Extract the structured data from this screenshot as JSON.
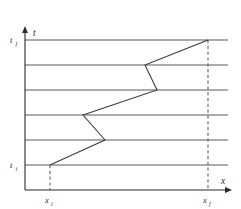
{
  "figure": {
    "kind": "spacetime-diagram",
    "axes": {
      "x_axis_label": "x",
      "t_axis_label": "t",
      "x_axis_label_name": "x-axis-label",
      "t_axis_label_name": "t-axis-label"
    },
    "ticks": {
      "t_initial_base": "t",
      "t_initial_sub": "i",
      "t_final_base": "t",
      "t_final_sub": "f",
      "x_initial_base": "x",
      "x_initial_sub": "i",
      "x_final_base": "x",
      "x_final_sub": "f"
    },
    "colors": {
      "axis": "#2b2b2b",
      "slice": "#5a5a5a",
      "path": "#3a3a3a",
      "background": "#ffffff"
    },
    "geometry": {
      "origin_x": 25,
      "origin_y": 190,
      "t_axis_top": 28,
      "x_axis_right": 232,
      "slice_left": 25,
      "slice_right": 228,
      "time_slice_y": [
        40,
        65,
        90,
        115,
        140,
        165
      ],
      "x_initial": 50,
      "x_final": 208,
      "dashed_x_i_top": 165,
      "dashed_x_i_bottom": 190,
      "dashed_x_f_top": 40,
      "dashed_x_f_bottom": 190
    },
    "worldline": {
      "name": "particle-worldline",
      "points": "50,165 105,140 83,115 157,90 145,65 208,40",
      "vertices": [
        {
          "x": 50,
          "t": 165,
          "slice": 0,
          "label": "start-at-x-i-t-i"
        },
        {
          "x": 105,
          "t": 140,
          "slice": 1,
          "label": "vertex-1"
        },
        {
          "x": 83,
          "t": 115,
          "slice": 2,
          "label": "vertex-2"
        },
        {
          "x": 157,
          "t": 90,
          "slice": 3,
          "label": "vertex-3"
        },
        {
          "x": 145,
          "t": 65,
          "slice": 4,
          "label": "vertex-4"
        },
        {
          "x": 208,
          "t": 40,
          "slice": 5,
          "label": "end-at-x-f-t-f"
        }
      ]
    }
  }
}
